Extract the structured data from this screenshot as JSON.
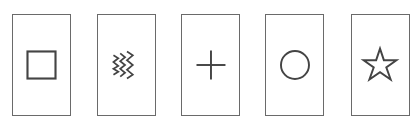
{
  "diagram": {
    "stroke_color": "#444444",
    "border_color": "#6a6a6a",
    "cards": [
      {
        "symbol": "square",
        "icon": "square-icon",
        "left": 12
      },
      {
        "symbol": "waves",
        "icon": "wavy-lines-icon",
        "left": 97
      },
      {
        "symbol": "plus",
        "icon": "plus-icon",
        "left": 181
      },
      {
        "symbol": "circle",
        "icon": "circle-icon",
        "left": 265
      },
      {
        "symbol": "star",
        "icon": "star-icon",
        "left": 351
      }
    ]
  }
}
